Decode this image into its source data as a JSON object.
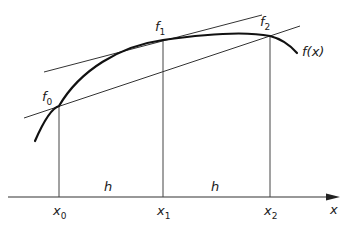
{
  "diagram": {
    "title": "",
    "curve_label": "f(x)",
    "axis_label": "x",
    "colors": {
      "ink": "#1a1a1a",
      "thin": "#333333",
      "background": "#ffffff"
    },
    "points": [
      {
        "f_base": "f",
        "f_sub": "0",
        "x_base": "x",
        "x_sub": "0"
      },
      {
        "f_base": "f",
        "f_sub": "1",
        "x_base": "x",
        "x_sub": "1"
      },
      {
        "f_base": "f",
        "f_sub": "2",
        "x_base": "x",
        "x_sub": "2"
      }
    ],
    "intervals": [
      {
        "label": "h"
      },
      {
        "label": "h"
      }
    ],
    "lines": [
      {
        "name": "tangent-at-f1",
        "description": "Tangent to f(x) at f1"
      },
      {
        "name": "chord-f0-f2",
        "description": "Secant through f0 and f2"
      }
    ]
  }
}
